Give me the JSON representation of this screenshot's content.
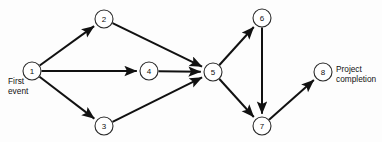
{
  "diagram": {
    "type": "directed-network",
    "colors": {
      "background": "#fdfdfd",
      "edge": "#111111",
      "node_stroke": "#2a2a2a",
      "node_fill": "#ffffff",
      "text": "#111111"
    },
    "node_radius": 9,
    "nodes": [
      {
        "id": "1",
        "label": "1",
        "x": 32,
        "y": 71
      },
      {
        "id": "2",
        "label": "2",
        "x": 104,
        "y": 19
      },
      {
        "id": "3",
        "label": "3",
        "x": 104,
        "y": 126
      },
      {
        "id": "4",
        "label": "4",
        "x": 149,
        "y": 71
      },
      {
        "id": "5",
        "label": "5",
        "x": 213,
        "y": 72
      },
      {
        "id": "6",
        "label": "6",
        "x": 262,
        "y": 18
      },
      {
        "id": "7",
        "label": "7",
        "x": 262,
        "y": 126
      },
      {
        "id": "8",
        "label": "8",
        "x": 323,
        "y": 72
      }
    ],
    "edges": [
      {
        "from": "1",
        "to": "2"
      },
      {
        "from": "1",
        "to": "4"
      },
      {
        "from": "1",
        "to": "3"
      },
      {
        "from": "2",
        "to": "5"
      },
      {
        "from": "4",
        "to": "5"
      },
      {
        "from": "3",
        "to": "5"
      },
      {
        "from": "5",
        "to": "6"
      },
      {
        "from": "5",
        "to": "7"
      },
      {
        "from": "6",
        "to": "7"
      },
      {
        "from": "7",
        "to": "8"
      }
    ],
    "annotations": {
      "first_event": "First\nevent",
      "project_completion": "Project\ncompletion"
    }
  }
}
